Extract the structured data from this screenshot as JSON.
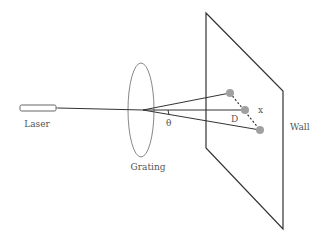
{
  "diagram": {
    "labels": {
      "laser": "Laser",
      "grating": "Grating",
      "wall": "Wall",
      "angle": "θ",
      "distance": "D",
      "spacing": "x"
    },
    "colors": {
      "line": "#333333",
      "grating": "#888888",
      "dot": "#a0a0a0",
      "text": "#555555"
    }
  }
}
